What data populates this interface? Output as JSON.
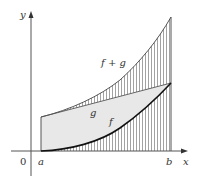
{
  "diagram": {
    "labels": {
      "y_axis": "y",
      "x_axis": "x",
      "origin": "0",
      "a": "a",
      "b": "b",
      "f_plus_g": "f + g",
      "g": "g",
      "f": "f"
    },
    "colors": {
      "curve": "#222222",
      "axis": "#555555",
      "hatch": "#888888",
      "fill_between_f_g": "#e6e6e6",
      "text": "#333333"
    },
    "curves": {
      "f": "M41,151 C70,150 100,142 120,128 C140,114 158,97 171,83",
      "g": "M41,117 L171,83",
      "f_plus_g": "M41,117 C70,110 100,96 120,80 C140,62 158,40 171,17"
    }
  }
}
